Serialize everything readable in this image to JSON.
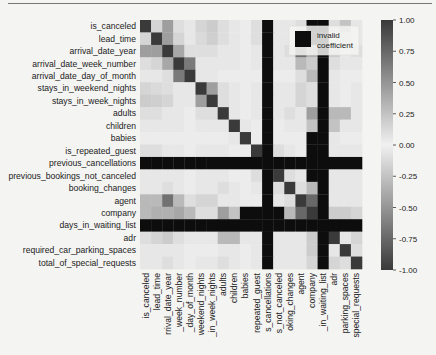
{
  "chart_data": {
    "type": "heatmap",
    "title": "",
    "xlabel": "",
    "ylabel": "",
    "labels_y": [
      "is_canceled",
      "lead_time",
      "arrival_date_year",
      "arrival_date_week_number",
      "arrival_date_day_of_month",
      "stays_in_weekend_nights",
      "stays_in_week_nights",
      "adults",
      "children",
      "babies",
      "is_repeated_guest",
      "previous_cancellations",
      "previous_bookings_not_canceled",
      "booking_changes",
      "agent",
      "company",
      "days_in_waiting_list",
      "adr",
      "required_car_parking_spaces",
      "total_of_special_requests"
    ],
    "labels_x": [
      "is_canceled",
      "lead_time",
      "rrival_date_year",
      "_week_number",
      "_day_of_month",
      "weekend_nights",
      "_in_week_nights",
      "adults",
      "children",
      "babies",
      "repeated_guest",
      "s_cancellations",
      "s_not_canceled",
      "oking_changes",
      "agent",
      "company",
      "_in_waiting_list",
      "adr",
      "parking_spaces",
      "special_requests"
    ],
    "colorbar": {
      "min": -1.0,
      "max": 1.0,
      "ticks": [
        "1.00",
        "0.75",
        "0.50",
        "0.25",
        "0.00",
        "-0.25",
        "-0.50",
        "-0.75",
        "-1.00"
      ]
    },
    "legend": {
      "label_line1": "invalid",
      "label_line2": "coefficient",
      "position": "top-right",
      "color": "#111111"
    },
    "colors": {
      "extreme": "#3a3a3a",
      "zero": "#f0f0f0",
      "invalid": "#0d0d0d"
    },
    "matrix": [
      [
        1.0,
        0.15,
        0.45,
        0.1,
        0.05,
        0.15,
        0.2,
        0.1,
        0.05,
        0.02,
        0.1,
        null,
        0.05,
        0.05,
        0.1,
        null,
        null,
        0.1,
        0.25,
        0.05
      ],
      [
        0.15,
        1.0,
        0.45,
        0.15,
        0.05,
        0.12,
        0.18,
        0.1,
        0.05,
        0.02,
        0.1,
        null,
        0.05,
        0.05,
        0.1,
        null,
        null,
        0.05,
        0.1,
        0.05
      ],
      [
        0.45,
        0.45,
        1.0,
        0.4,
        0.1,
        0.1,
        0.1,
        0.05,
        0.05,
        0.02,
        0.05,
        null,
        0.05,
        0.1,
        0.7,
        0.35,
        null,
        0.2,
        0.05,
        0.1
      ],
      [
        0.1,
        0.15,
        0.4,
        1.0,
        0.65,
        0.05,
        0.05,
        0.05,
        0.05,
        0.02,
        0.05,
        null,
        0.05,
        0.05,
        0.3,
        0.2,
        null,
        0.1,
        0.05,
        0.05
      ],
      [
        0.05,
        0.05,
        0.1,
        0.65,
        1.0,
        0.05,
        0.05,
        0.02,
        0.02,
        0.02,
        0.02,
        null,
        0.02,
        0.02,
        0.1,
        0.3,
        null,
        0.05,
        0.02,
        0.02
      ],
      [
        0.15,
        0.12,
        0.1,
        0.05,
        0.05,
        1.0,
        0.45,
        0.1,
        0.05,
        0.02,
        0.05,
        null,
        0.05,
        0.05,
        0.15,
        0.1,
        null,
        0.05,
        0.02,
        0.05
      ],
      [
        0.2,
        0.18,
        0.15,
        0.05,
        0.05,
        0.45,
        1.0,
        0.1,
        0.05,
        0.02,
        0.05,
        null,
        0.05,
        0.05,
        0.15,
        0.1,
        null,
        0.05,
        0.02,
        0.05
      ],
      [
        0.1,
        0.1,
        0.05,
        0.05,
        0.02,
        0.1,
        0.1,
        1.0,
        0.05,
        0.02,
        0.05,
        null,
        0.05,
        0.1,
        0.05,
        0.45,
        null,
        0.3,
        0.3,
        0.05
      ],
      [
        0.05,
        0.05,
        0.05,
        0.05,
        0.02,
        0.05,
        0.05,
        0.05,
        1.0,
        0.05,
        0.02,
        null,
        0.02,
        0.05,
        0.05,
        0.25,
        null,
        0.25,
        0.05,
        0.05
      ],
      [
        0.02,
        0.02,
        0.02,
        0.02,
        0.02,
        0.02,
        0.02,
        0.02,
        0.05,
        1.0,
        0.02,
        null,
        0.02,
        0.02,
        0.02,
        null,
        null,
        0.05,
        0.02,
        0.02
      ],
      [
        0.1,
        0.1,
        0.05,
        0.05,
        0.02,
        0.05,
        0.05,
        0.05,
        0.02,
        0.02,
        1.0,
        null,
        0.1,
        0.05,
        0.02,
        null,
        null,
        0.05,
        0.05,
        0.05
      ],
      [
        null,
        null,
        null,
        null,
        null,
        null,
        null,
        null,
        null,
        null,
        null,
        null,
        null,
        null,
        null,
        null,
        null,
        null,
        null,
        null
      ],
      [
        0.05,
        0.05,
        0.05,
        0.05,
        0.02,
        0.05,
        0.05,
        0.05,
        0.02,
        0.02,
        0.1,
        null,
        1.0,
        0.1,
        0.05,
        null,
        null,
        0.05,
        0.05,
        0.05
      ],
      [
        0.05,
        0.05,
        0.1,
        0.05,
        0.02,
        0.05,
        0.05,
        0.1,
        0.05,
        0.02,
        0.05,
        null,
        0.1,
        1.0,
        0.1,
        0.3,
        null,
        0.05,
        0.05,
        0.05
      ],
      [
        0.3,
        0.3,
        0.7,
        0.3,
        0.1,
        0.15,
        0.15,
        0.05,
        0.05,
        0.02,
        0.02,
        null,
        0.05,
        0.1,
        1.0,
        0.75,
        null,
        0.05,
        0.05,
        0.05
      ],
      [
        0.3,
        0.35,
        0.35,
        0.4,
        0.3,
        0.1,
        0.1,
        0.45,
        0.25,
        null,
        null,
        null,
        null,
        0.3,
        0.75,
        1.0,
        null,
        0.2,
        0.2,
        0.15
      ],
      [
        null,
        null,
        null,
        null,
        null,
        null,
        null,
        null,
        null,
        null,
        null,
        null,
        null,
        null,
        null,
        null,
        null,
        null,
        null,
        null
      ],
      [
        0.1,
        0.15,
        0.2,
        0.1,
        0.05,
        0.05,
        0.05,
        0.3,
        0.3,
        0.05,
        0.05,
        null,
        0.05,
        0.05,
        0.05,
        0.2,
        null,
        1.0,
        0.05,
        0.15
      ],
      [
        0.05,
        0.05,
        0.05,
        0.05,
        0.02,
        0.02,
        0.02,
        0.05,
        0.05,
        0.02,
        0.05,
        null,
        0.05,
        0.05,
        0.05,
        0.2,
        null,
        0.05,
        1.0,
        0.1
      ],
      [
        0.05,
        0.05,
        0.1,
        0.05,
        0.02,
        0.05,
        0.05,
        0.1,
        0.05,
        0.02,
        0.05,
        null,
        0.05,
        0.05,
        0.05,
        0.15,
        null,
        0.15,
        0.1,
        1.0
      ]
    ]
  }
}
